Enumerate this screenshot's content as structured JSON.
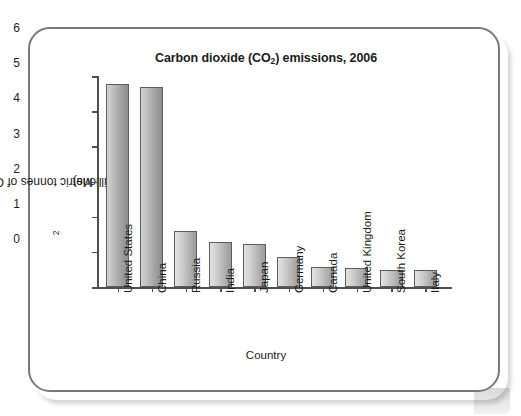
{
  "chart_data": {
    "type": "bar",
    "title": "Carbon dioxide (CO2) emissions, 2006",
    "title_main": "Carbon dioxide (CO",
    "title_sub": "2",
    "title_tail": ") emissions, 2006",
    "xlabel": "Country",
    "ylabel": "Metric tonnes of CO2 (millions)",
    "ylabel_main": "Metric tonnes of CO",
    "ylabel_sub": "2",
    "ylabel_tail": " (millions)",
    "categories": [
      "United States",
      "China",
      "Russia",
      "India",
      "Japan",
      "Germany",
      "Canada",
      "United Kingdom",
      "South Korea",
      "Italy"
    ],
    "values": [
      5.77,
      5.68,
      1.59,
      1.27,
      1.23,
      0.86,
      0.57,
      0.55,
      0.49,
      0.47
    ],
    "ylim": [
      0,
      6
    ],
    "ytick_labels": [
      "6",
      "5",
      "4",
      "3",
      "2",
      "1",
      "0"
    ],
    "ytick_values": [
      6,
      5,
      4,
      3,
      2,
      1,
      0
    ],
    "grid": false,
    "legend": "none",
    "bar_color": "#b5b5b5",
    "bar_edge_color": "#5d5d5d",
    "axis_color": "#4f4f4f",
    "frame_color": "#77787a"
  }
}
